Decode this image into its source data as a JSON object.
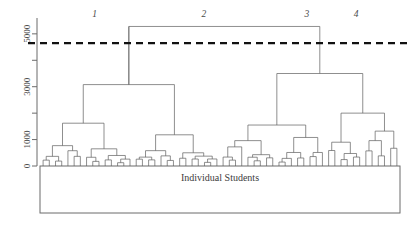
{
  "figure": {
    "title_visible": false,
    "background_color": "#ffffff",
    "line_color": "#5e5e5e",
    "axis_color": "#6b6b6b",
    "cut_line_color": "#111111"
  },
  "axes": {
    "x_title": "Individual Students",
    "y_ticks": [
      {
        "value": 0,
        "label": "0"
      },
      {
        "value": 1000,
        "label": "1000"
      },
      {
        "value": 2000,
        "label": ""
      },
      {
        "value": 3000,
        "label": "3000"
      },
      {
        "value": 4000,
        "label": ""
      },
      {
        "value": 5000,
        "label": "5000"
      }
    ],
    "y_range": [
      0,
      5600
    ],
    "y_label_rotation": -90
  },
  "cut_line": {
    "value": 4650,
    "label": "",
    "style": "dashed",
    "clusters_produced": 4
  },
  "cluster_labels": [
    {
      "text": "1",
      "x_frac": 0.152
    },
    {
      "text": "2",
      "x_frac": 0.455
    },
    {
      "text": "3",
      "x_frac": 0.741
    },
    {
      "text": "4",
      "x_frac": 0.878
    }
  ],
  "chart_data": {
    "type": "dendrogram",
    "title": "",
    "xlabel": "Individual Students",
    "ylabel": "",
    "ylim": [
      0,
      5600
    ],
    "grid": false,
    "legend": "none",
    "n_leaves": 96,
    "cut_height": 4650,
    "n_clusters": 4,
    "cluster_names": [
      "1",
      "2",
      "3",
      "4"
    ],
    "nodes": [
      {
        "id": "root",
        "height": 5280,
        "left": "A",
        "right": "B"
      },
      {
        "id": "A",
        "height": 3080,
        "left": "A1",
        "right": "A2"
      },
      {
        "id": "A1",
        "height": 1620,
        "left": "A1a",
        "right": "A1b"
      },
      {
        "id": "A1a",
        "height": 760,
        "left": "A1a1",
        "right": "A1a2"
      },
      {
        "id": "A1a1",
        "height": 330,
        "left": "L0",
        "right": "L1"
      },
      {
        "id": "A1a2",
        "height": 430,
        "left": "L2",
        "right": "L3"
      },
      {
        "id": "A1b",
        "height": 640,
        "left": "A1b1",
        "right": "A1b2"
      },
      {
        "id": "A1b1",
        "height": 300,
        "left": "L4",
        "right": "L5"
      },
      {
        "id": "A1b2",
        "height": 260,
        "left": "L6",
        "right": "L7"
      },
      {
        "id": "A2",
        "height": 1180,
        "left": "A2a",
        "right": "A2b"
      },
      {
        "id": "A2a",
        "height": 560,
        "left": "L8",
        "right": "L9"
      },
      {
        "id": "A2b",
        "height": 480,
        "left": "L10",
        "right": "L11"
      },
      {
        "id": "B",
        "height": 3500,
        "left": "B1",
        "right": "B2"
      },
      {
        "id": "B1",
        "height": 1550,
        "left": "B1a",
        "right": "B1b"
      },
      {
        "id": "B2",
        "height": 2000,
        "left": "B2a",
        "right": "B2b"
      }
    ],
    "leaf_label": "Individual Students"
  },
  "panel": {
    "has_border_box": true
  }
}
